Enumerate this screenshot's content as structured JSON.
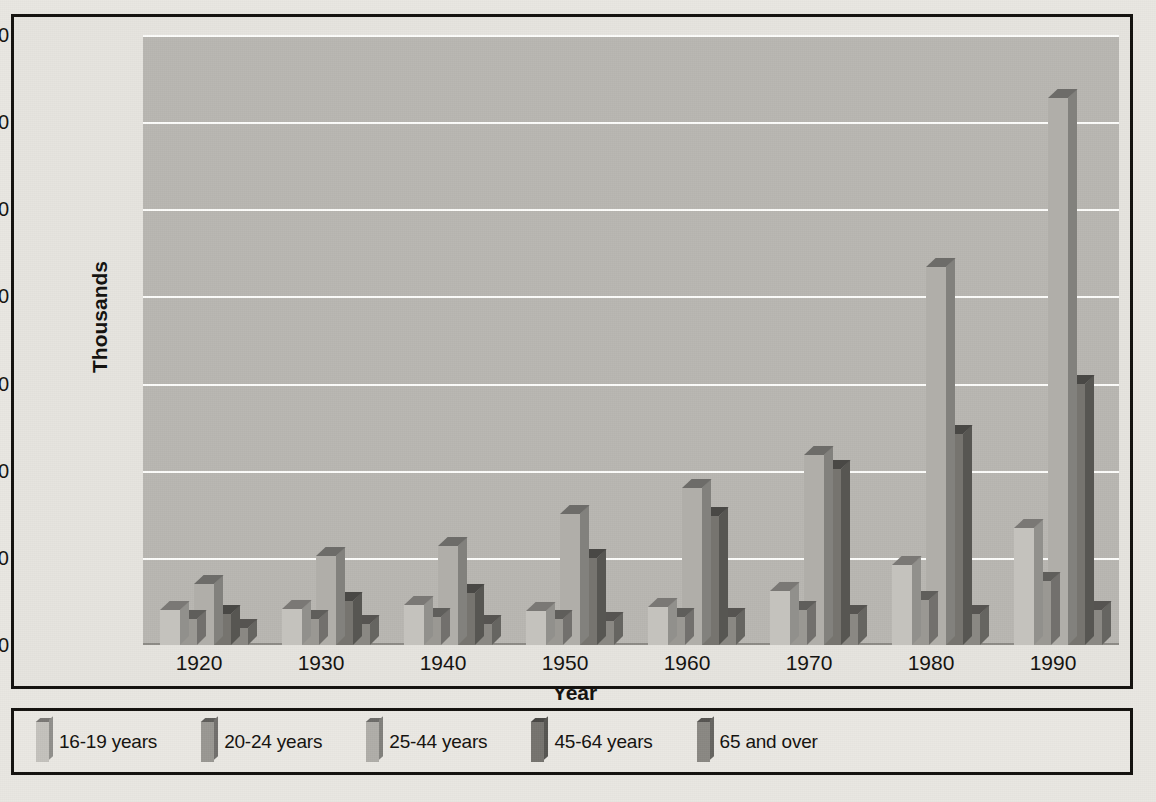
{
  "chart_data": {
    "type": "bar",
    "title": "",
    "xlabel": "Year",
    "ylabel": "Thousands",
    "categories": [
      "1920",
      "1930",
      "1940",
      "1950",
      "1960",
      "1970",
      "1980",
      "1990"
    ],
    "ylim": [
      0,
      35000
    ],
    "ytick_labels": [
      "0",
      "5,000",
      "10,000",
      "15,000",
      "20,000",
      "25,000",
      "30,000",
      "35,000"
    ],
    "ytick_values": [
      0,
      5000,
      10000,
      15000,
      20000,
      25000,
      30000,
      35000
    ],
    "grid": true,
    "legend_position": "bottom",
    "series": [
      {
        "name": "16-19 years",
        "color": "#c4c2bd",
        "values": [
          2000,
          2050,
          2300,
          1950,
          2200,
          3100,
          4600,
          6700
        ]
      },
      {
        "name": "20-24 years",
        "color": "#9a9893",
        "values": [
          1500,
          1500,
          1600,
          1500,
          1600,
          2000,
          2600,
          3700
        ]
      },
      {
        "name": "25-44 years",
        "color": "#b0aea9",
        "values": [
          3500,
          5100,
          5700,
          7500,
          9000,
          10900,
          21700,
          31400
        ]
      },
      {
        "name": "45-64 years",
        "color": "#76746f",
        "values": [
          1800,
          2500,
          3000,
          5000,
          7400,
          10100,
          12100,
          15000
        ]
      },
      {
        "name": "65 and over",
        "color": "#8a8883",
        "values": [
          1000,
          1200,
          1200,
          1400,
          1600,
          1800,
          1800,
          2000
        ]
      }
    ]
  },
  "colors": {
    "plot_background": "#b9b7b2",
    "page_background": "#e9e7e2",
    "frame": "#14120f",
    "gridline": "#fdfdfb"
  },
  "legend": {
    "items": [
      {
        "label": "16-19 years"
      },
      {
        "label": "20-24 years"
      },
      {
        "label": "25-44 years"
      },
      {
        "label": "45-64 years"
      },
      {
        "label": "65 and over"
      }
    ]
  }
}
